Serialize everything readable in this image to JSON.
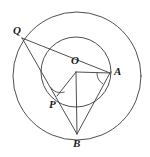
{
  "figure": {
    "stroke_color": "#3b3b3b",
    "label_color": "#1a1a1a",
    "background_color": "#ffffff",
    "labels": {
      "center": "O",
      "point_q": "Q",
      "point_p": "P",
      "point_a": "A",
      "point_b": "B"
    },
    "circles": [
      {
        "name": "outer-circle",
        "cx": 77,
        "cy": 76,
        "r": 64
      },
      {
        "name": "inner-circle",
        "cx": 76,
        "cy": 72,
        "r": 35
      }
    ],
    "points": [
      {
        "name": "O",
        "x": 76,
        "y": 72,
        "label_x": 72,
        "label_y": 56
      },
      {
        "name": "Q",
        "x": 22,
        "y": 38,
        "label_x": 13,
        "label_y": 25
      },
      {
        "name": "P",
        "x": 57,
        "y": 96,
        "label_x": 50,
        "label_y": 99
      },
      {
        "name": "A",
        "x": 110,
        "y": 73,
        "label_x": 114,
        "label_y": 66
      },
      {
        "name": "B",
        "x": 77,
        "y": 134,
        "label_x": 74,
        "label_y": 137
      }
    ],
    "segments": [
      {
        "name": "segment-QA",
        "from": "Q",
        "to": "A"
      },
      {
        "name": "segment-QB",
        "from": "Q",
        "to": "B"
      },
      {
        "name": "segment-OP",
        "from": "O",
        "to": "P"
      },
      {
        "name": "segment-OA",
        "from": "O",
        "to": "A"
      },
      {
        "name": "segment-OB",
        "from": "O",
        "to": "B"
      },
      {
        "name": "segment-AB",
        "from": "A",
        "to": "B"
      }
    ],
    "angle_marks": [
      {
        "name": "angle-mark-at-P",
        "vertex": "P",
        "between": [
          "Q",
          "B"
        ]
      },
      {
        "name": "angle-mark-at-A",
        "vertex": "A",
        "between": [
          "O",
          "B"
        ]
      }
    ]
  }
}
